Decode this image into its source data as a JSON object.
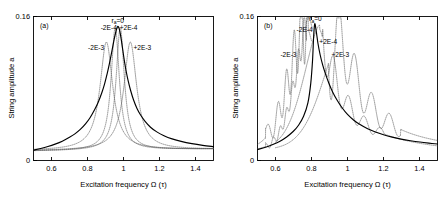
{
  "figure": {
    "panels": [
      {
        "id": "a",
        "panel_label": "(a)",
        "annotations": [
          {
            "name": "ra-zero",
            "text": "r",
            "sub": "a",
            "rest": "=0",
            "x": 0.968,
            "y": 0.153
          },
          {
            "name": "minus-2e-4",
            "text": "-2E-4",
            "x": 0.918,
            "y": 0.1455
          },
          {
            "name": "plus-2e-4",
            "text": "+2E-4",
            "x": 1.028,
            "y": 0.1455
          },
          {
            "name": "minus-2e-3",
            "text": "-2E-3",
            "x": 0.848,
            "y": 0.123
          },
          {
            "name": "plus-2e-3",
            "text": "+2E-3",
            "x": 1.105,
            "y": 0.123
          }
        ]
      },
      {
        "id": "b",
        "panel_label": "(b)",
        "annotations": [
          {
            "name": "ra-zero",
            "text": "r",
            "sub": "a",
            "rest": "=0",
            "x": 0.822,
            "y": 0.1545
          },
          {
            "name": "minus-2e-4",
            "text": "-2E-4",
            "x": 0.762,
            "y": 0.1425
          },
          {
            "name": "plus-2e-4",
            "text": "+2E-4",
            "x": 0.893,
            "y": 0.129
          },
          {
            "name": "minus-2e-3",
            "text": "-2E-3",
            "x": 0.672,
            "y": 0.1155
          },
          {
            "name": "plus-2e-3",
            "text": "+2E-3",
            "x": 0.96,
            "y": 0.115
          }
        ]
      }
    ]
  },
  "chart_data": {
    "type": "line",
    "title": "",
    "xlabel": "Excitation frequency Ω (τ)",
    "ylabel": "String amplitude a",
    "xlim": [
      0.5,
      1.5
    ],
    "ylim": [
      0.0,
      0.16
    ],
    "xticks": [
      0.6,
      0.8,
      1.0,
      1.2,
      1.4
    ],
    "xticklabels": [
      "0.6",
      "0.8",
      "1",
      "1.2",
      "1.4"
    ],
    "yticks": [
      0.0,
      0.16
    ],
    "yticklabels": [
      "0",
      "0.16"
    ],
    "grid": false,
    "legend_position": "inline-annotations",
    "panels": [
      {
        "id": "a",
        "label": "(a)",
        "series": [
          {
            "name": "r_a=0",
            "style": "solid",
            "color": "#000000",
            "comment": "symmetric resonance peak, linear Lorentzian-like response",
            "peak_x": 0.968,
            "peak_y": 0.149,
            "x": [
              0.5,
              0.54,
              0.58,
              0.62,
              0.66,
              0.7,
              0.73,
              0.76,
              0.79,
              0.815,
              0.84,
              0.86,
              0.88,
              0.895,
              0.91,
              0.922,
              0.932,
              0.94,
              0.948,
              0.954,
              0.96,
              0.964,
              0.968,
              0.972,
              0.976,
              0.982,
              0.988,
              0.996,
              1.004,
              1.014,
              1.026,
              1.04,
              1.056,
              1.075,
              1.095,
              1.12,
              1.15,
              1.185,
              1.225,
              1.27,
              1.32,
              1.38,
              1.44,
              1.5
            ],
            "y": [
              0.0115,
              0.0133,
              0.0155,
              0.0182,
              0.0215,
              0.0258,
              0.0296,
              0.0345,
              0.041,
              0.0478,
              0.0566,
              0.065,
              0.0756,
              0.0852,
              0.097,
              0.1078,
              0.1178,
              0.1262,
              0.1345,
              0.14,
              0.145,
              0.1472,
              0.149,
              0.1485,
              0.1465,
              0.141,
              0.1338,
              0.1228,
              0.1118,
              0.1,
              0.0885,
              0.0775,
              0.0672,
              0.0578,
              0.0505,
              0.0435,
              0.037,
              0.0318,
              0.0275,
              0.024,
              0.0212,
              0.0187,
              0.0168,
              0.0154
            ]
          },
          {
            "name": "-2E-4",
            "style": "dotted",
            "color": "#555555",
            "comment": "slightly left-shifted peak, nearly overlapping r_a=0",
            "peak_x": 0.955,
            "peak_y": 0.147,
            "shift": -0.014
          },
          {
            "name": "+2E-4",
            "style": "dotted",
            "color": "#555555",
            "comment": "slightly right-shifted peak, nearly overlapping r_a=0",
            "peak_x": 0.982,
            "peak_y": 0.147,
            "shift": 0.014
          },
          {
            "name": "-2E-3",
            "style": "dotted",
            "color": "#555555",
            "comment": "strongly left-shifted, broadened and lowered peak",
            "peak_x": 0.905,
            "peak_y": 0.13,
            "shift": -0.063,
            "amp_scale": 0.872,
            "width_scale": 1.55
          },
          {
            "name": "+2E-3",
            "style": "dotted",
            "color": "#555555",
            "comment": "strongly right-shifted, broadened and lowered peak",
            "peak_x": 1.038,
            "peak_y": 0.13,
            "shift": 0.07,
            "amp_scale": 0.872,
            "width_scale": 1.55
          }
        ]
      },
      {
        "id": "b",
        "label": "(b)",
        "series": [
          {
            "name": "r_a=0",
            "style": "solid",
            "color": "#000000",
            "comment": "asymmetric softening backbone, sharp drop on the high-frequency side of peak",
            "peak_x": 0.812,
            "peak_y": 0.1545,
            "x": [
              0.5,
              0.545,
              0.585,
              0.625,
              0.662,
              0.698,
              0.728,
              0.756,
              0.78,
              0.796,
              0.806,
              0.812,
              0.818,
              0.826,
              0.836,
              0.848,
              0.862,
              0.878,
              0.896,
              0.916,
              0.94,
              0.968,
              1.0,
              1.035,
              1.072,
              1.112,
              1.155,
              1.2,
              1.248,
              1.298,
              1.35,
              1.402,
              1.452,
              1.5
            ],
            "y": [
              0.0122,
              0.0148,
              0.0178,
              0.0215,
              0.0262,
              0.0322,
              0.0392,
              0.0492,
              0.064,
              0.086,
              0.112,
              0.138,
              0.152,
              0.144,
              0.13,
              0.1175,
              0.1062,
              0.096,
              0.0862,
              0.0768,
              0.0678,
              0.0592,
              0.0512,
              0.0448,
              0.0396,
              0.0352,
              0.0316,
              0.0286,
              0.026,
              0.0238,
              0.022,
              0.0205,
              0.0193,
              0.0183
            ]
          },
          {
            "name": "-2E-4",
            "style": "dotted",
            "color": "#555555",
            "comment": "left-shifted sharp peak near 0.79 with small ripples below",
            "peak_x": 0.79,
            "peak_y": 0.1455,
            "shift": -0.022
          },
          {
            "name": "+2E-4",
            "style": "dotted",
            "color": "#555555",
            "comment": "right-shifted peak near 0.845 with decaying ripples",
            "peak_x": 0.845,
            "peak_y": 0.133,
            "shift": 0.033
          },
          {
            "name": "-2E-3",
            "style": "dotted",
            "color": "#555555",
            "comment": "strongly left-shifted with large oscillatory side lobes at 0.60-0.72",
            "peak_x": 0.77,
            "peak_y": 0.1425,
            "shift": -0.042,
            "ripple_region": [
              0.55,
              0.78
            ]
          },
          {
            "name": "+2E-3",
            "style": "dotted",
            "color": "#555555",
            "comment": "strongly right-shifted with large decaying oscillatory lobes 0.93-1.25",
            "peak_x": 0.963,
            "peak_y": 0.115,
            "shift": 0.15,
            "ripple_region": [
              0.9,
              1.3
            ]
          }
        ]
      }
    ]
  }
}
